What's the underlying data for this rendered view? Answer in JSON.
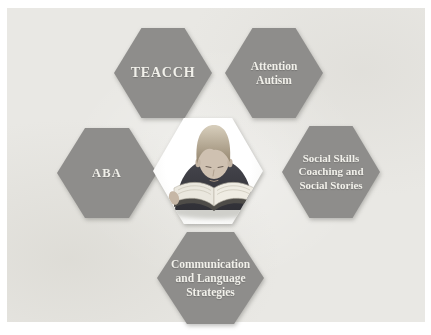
{
  "colors": {
    "page_bg": "#ffffff",
    "panel_bg": "#e9e8e4",
    "hexagon": "#8e8d8b",
    "hexagon_text": "#f1f0ea",
    "center_bg": "#ffffff"
  },
  "diagram": {
    "center_photo_alt": "Photo of a young boy reading a large open book",
    "nodes": [
      {
        "id": "teacch",
        "lines": [
          "TEACCH"
        ]
      },
      {
        "id": "attention-autism",
        "lines": [
          "Attention",
          "Autism"
        ]
      },
      {
        "id": "aba",
        "lines": [
          "ABA"
        ]
      },
      {
        "id": "social-skills",
        "lines": [
          "Social Skills",
          "Coaching and",
          "Social Stories"
        ]
      },
      {
        "id": "communication-language",
        "lines": [
          "Communication",
          "and Language",
          "Strategies"
        ]
      }
    ]
  }
}
